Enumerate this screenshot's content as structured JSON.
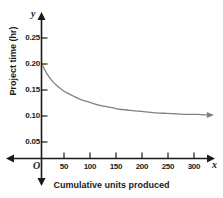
{
  "chart_data": {
    "type": "line",
    "title": "",
    "xlabel": "Cumulative units produced",
    "ylabel": "Project time (hr)",
    "xlim": [
      0,
      325
    ],
    "ylim": [
      0,
      0.275
    ],
    "grid": false,
    "legend": null,
    "axis_letters": {
      "origin": "O",
      "x": "x",
      "y": "y"
    },
    "xticks": [
      50,
      100,
      150,
      200,
      250,
      300
    ],
    "xtick_labels": [
      "50",
      "100",
      "150",
      "200",
      "250",
      "300"
    ],
    "yticks": [
      0.05,
      0.1,
      0.15,
      0.2,
      0.25
    ],
    "ytick_labels": [
      "0.05",
      "0.10",
      "0.15",
      "0.20",
      "0.25"
    ],
    "series": [
      {
        "name": "learning-curve",
        "color": "#808080",
        "arrow_end": true,
        "x": [
          2,
          10,
          20,
          30,
          40,
          50,
          60,
          70,
          80,
          90,
          100,
          110,
          120,
          130,
          140,
          150,
          160,
          170,
          180,
          190,
          200,
          220,
          240,
          260,
          280,
          300,
          320
        ],
        "y": [
          0.197,
          0.182,
          0.168,
          0.158,
          0.15,
          0.144,
          0.139,
          0.134,
          0.13,
          0.127,
          0.124,
          0.121,
          0.119,
          0.117,
          0.115,
          0.113,
          0.112,
          0.111,
          0.11,
          0.109,
          0.108,
          0.106,
          0.105,
          0.104,
          0.103,
          0.103,
          0.102
        ]
      }
    ]
  },
  "colors": {
    "axis": "#1a1a1a",
    "curve": "#808080",
    "background": "#ffffff"
  }
}
